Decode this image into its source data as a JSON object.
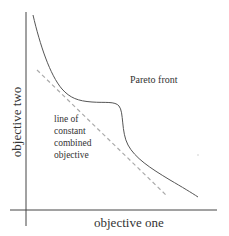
{
  "diagram": {
    "type": "pareto-front-illustration",
    "axes": {
      "x_label": "objective one",
      "y_label": "objective two"
    },
    "annotations": {
      "pareto_front_label": "Pareto front",
      "constant_line_label_lines": [
        "line of",
        "constant",
        "combined",
        "objective"
      ]
    },
    "curves": {
      "pareto_front": {
        "style": "solid",
        "color": "#555555"
      },
      "constant_combined_objective": {
        "style": "dashed",
        "color": "#aaaaaa"
      }
    }
  }
}
